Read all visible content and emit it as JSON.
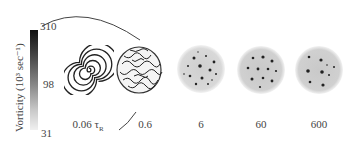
{
  "colorbar": {
    "label": "Vorticity (10³ sec⁻¹)",
    "ticks": [
      "310",
      "98",
      "31"
    ],
    "max": 310,
    "mid": 98,
    "min": 31,
    "colors": [
      "#111111",
      "#888888",
      "#f0f0f0"
    ]
  },
  "panels": [
    {
      "time_label": "0.06",
      "unit": "τ",
      "unit_sub": "R",
      "pattern": "spiral"
    },
    {
      "time_label": "0.6",
      "pattern": "turbulent"
    },
    {
      "time_label": "6",
      "pattern": "many-vortices"
    },
    {
      "time_label": "60",
      "pattern": "vortex-crystal"
    },
    {
      "time_label": "600",
      "pattern": "vortex-crystal-sparse"
    }
  ]
}
